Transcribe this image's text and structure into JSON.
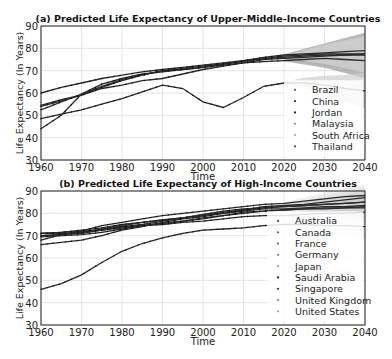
{
  "chart_data": [
    {
      "type": "line",
      "title": "(a) Predicted Life Expectancy of Upper-Middle-Income Countries",
      "xlabel": "Time",
      "ylabel": "Life Expectancy (In Years)",
      "xlim": [
        1960,
        2040
      ],
      "ylim": [
        30,
        90
      ],
      "xticks": [
        1960,
        1970,
        1980,
        1990,
        2000,
        2010,
        2020,
        2030,
        2040
      ],
      "yticks": [
        30,
        40,
        50,
        60,
        70,
        80,
        90
      ],
      "grid": true,
      "legend_position": "lower right",
      "forecast_start": 2019,
      "x": [
        1960,
        1965,
        1970,
        1975,
        1980,
        1985,
        1990,
        1995,
        2000,
        2005,
        2010,
        2015,
        2020,
        2025,
        2030,
        2035,
        2040
      ],
      "series": [
        {
          "name": "Brazil",
          "color": "#555555",
          "values": [
            54.5,
            57,
            59,
            62,
            63.5,
            65.5,
            66.5,
            68.5,
            70.5,
            72,
            73.5,
            75,
            75.5,
            76,
            76.5,
            77,
            77.5
          ]
        },
        {
          "name": "China",
          "color": "#333333",
          "values": [
            44,
            50,
            59.5,
            64,
            66.5,
            68.5,
            69.5,
            70.5,
            71.5,
            73,
            74.5,
            76,
            77,
            77.5,
            78,
            78.5,
            79
          ]
        },
        {
          "name": "Jordan",
          "color": "#222222",
          "values": [
            52.5,
            56,
            59.5,
            63,
            66,
            68,
            70,
            70.5,
            71.5,
            72.5,
            73.5,
            74,
            74.5,
            75,
            75.5,
            75,
            74.5
          ]
        },
        {
          "name": "Malaysia",
          "color": "#888888",
          "values": [
            60,
            62.5,
            64.5,
            66.5,
            68,
            69.5,
            70.5,
            71.5,
            72.5,
            73.5,
            74.5,
            75.5,
            76,
            76.5,
            77,
            77,
            77
          ]
        },
        {
          "name": "South Africa",
          "color": "#aaaaaa",
          "values": [
            48.5,
            50.5,
            52.5,
            55,
            57.5,
            60.5,
            63.5,
            62,
            56,
            53.5,
            58,
            63,
            64.5,
            64.5,
            63.5,
            62,
            61
          ]
        },
        {
          "name": "Thailand",
          "color": "#444444",
          "values": [
            54,
            56.5,
            59,
            62.5,
            65.5,
            68,
            70,
            71,
            72,
            73,
            74,
            75.5,
            76.5,
            77,
            77.5,
            77.5,
            77.5
          ]
        }
      ]
    },
    {
      "type": "line",
      "title": "(b) Predicted Life Expectancy of High-Income Countries",
      "xlabel": "Time",
      "ylabel": "Life Expectancy (In Years)",
      "xlim": [
        1960,
        2040
      ],
      "ylim": [
        30,
        90
      ],
      "xticks": [
        1960,
        1970,
        1980,
        1990,
        2000,
        2010,
        2020,
        2030,
        2040
      ],
      "yticks": [
        30,
        40,
        50,
        60,
        70,
        80,
        90
      ],
      "grid": true,
      "legend_position": "lower right",
      "forecast_start": 2018,
      "x": [
        1960,
        1965,
        1970,
        1975,
        1980,
        1985,
        1990,
        1995,
        2000,
        2005,
        2010,
        2015,
        2020,
        2025,
        2030,
        2035,
        2040
      ],
      "series": [
        {
          "name": "Australia",
          "color": "#444444",
          "values": [
            71,
            71,
            71.5,
            73,
            74.5,
            76,
            77,
            78,
            79.5,
            81,
            82,
            82.5,
            83,
            83.5,
            84,
            84.5,
            85
          ]
        },
        {
          "name": "Canada",
          "color": "#555555",
          "values": [
            71,
            71.5,
            72.5,
            73.5,
            75,
            76,
            77,
            78,
            79,
            80,
            81,
            82,
            82,
            82.5,
            83,
            83,
            83.5
          ]
        },
        {
          "name": "France",
          "color": "#666666",
          "values": [
            70,
            70.5,
            71.5,
            72.5,
            74,
            75,
            76.5,
            78,
            79,
            80.5,
            81.5,
            82.5,
            83,
            83.5,
            84,
            84.5,
            85
          ]
        },
        {
          "name": "Germany",
          "color": "#777777",
          "values": [
            69.5,
            70,
            70.5,
            71.5,
            73,
            74.5,
            75.5,
            76.5,
            78,
            79,
            80,
            81,
            81.5,
            82,
            82,
            82.5,
            82.5
          ]
        },
        {
          "name": "Japan",
          "color": "#999999",
          "values": [
            68,
            70.5,
            72,
            74.5,
            76,
            77.5,
            79,
            80,
            81,
            82,
            83,
            84,
            84.5,
            85.5,
            86.5,
            87.5,
            88
          ]
        },
        {
          "name": "Saudi Arabia",
          "color": "#222222",
          "values": [
            46,
            48.5,
            52.5,
            58,
            63,
            66.5,
            69,
            71,
            72.5,
            73,
            73.5,
            74.5,
            75,
            75,
            74.5,
            74.5,
            74
          ]
        },
        {
          "name": "Singapore",
          "color": "#333333",
          "values": [
            66,
            67,
            68,
            70,
            72.5,
            74,
            76,
            77.5,
            78.5,
            80,
            81.5,
            83,
            83.5,
            84,
            85,
            86,
            87
          ]
        },
        {
          "name": "United Kingdom",
          "color": "#808080",
          "values": [
            71,
            71.5,
            72,
            72.5,
            73.5,
            74.5,
            75.5,
            76.5,
            77.5,
            79,
            80.5,
            81,
            81.5,
            82,
            82.5,
            82.5,
            83
          ]
        },
        {
          "name": "United States",
          "color": "#a0a0a0",
          "values": [
            70,
            70.5,
            71,
            72.5,
            74,
            74.5,
            75,
            76,
            76.5,
            77.5,
            78.5,
            79,
            79,
            79.5,
            80,
            80,
            80.5
          ]
        }
      ]
    }
  ]
}
